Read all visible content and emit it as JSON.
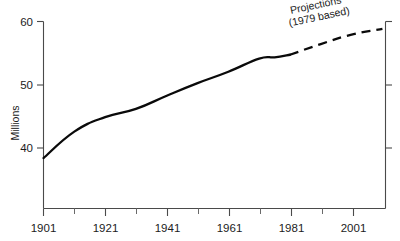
{
  "chart_data": {
    "type": "line",
    "title": "",
    "xlabel": "",
    "ylabel": "Millions",
    "xlim": [
      1901,
      2012
    ],
    "ylim": [
      33.6,
      61.0
    ],
    "grid": false,
    "legend": "none",
    "y_ticks": [
      "40",
      "50",
      "60"
    ],
    "y_tick_values": [
      40,
      50,
      60
    ],
    "x_ticks": [
      "1901",
      "1921",
      "1941",
      "1961",
      "1981",
      "2001"
    ],
    "x_tick_values": [
      1901,
      1921,
      1941,
      1961,
      1981,
      2001
    ],
    "x_minor_ticks": [
      1911,
      1931,
      1951,
      1971,
      1991,
      2011
    ],
    "annotations": [
      {
        "name": "projections-note",
        "line1": "Projections",
        "line2": "(1979 based)",
        "rotation_deg": -12
      }
    ],
    "series": [
      {
        "name": "Population (actual)",
        "style": "solid",
        "x": [
          1901,
          1911,
          1921,
          1931,
          1941,
          1951,
          1961,
          1971,
          1976,
          1981
        ],
        "values": [
          38.4,
          42.6,
          44.9,
          46.2,
          48.3,
          50.3,
          52.1,
          54.2,
          54.4,
          54.8
        ]
      },
      {
        "name": "Population (1979 based projections)",
        "style": "dashed",
        "x": [
          1981,
          1991,
          2001,
          2011
        ],
        "values": [
          54.8,
          56.5,
          58.0,
          58.9
        ]
      }
    ],
    "colors": {
      "series": "#0a0a0a",
      "axis": "#4a4a4a",
      "text": "#1c1c1c",
      "background": "#ffffff"
    }
  },
  "axis": {
    "y_label": "Millions",
    "y_tick_60": "60",
    "y_tick_50": "50",
    "y_tick_40": "40",
    "x_tick_1901": "1901",
    "x_tick_1921": "1921",
    "x_tick_1941": "1941",
    "x_tick_1961": "1961",
    "x_tick_1981": "1981",
    "x_tick_2001": "2001"
  },
  "annotation": {
    "projections_line1": "Projections",
    "projections_line2": "(1979 based)"
  }
}
